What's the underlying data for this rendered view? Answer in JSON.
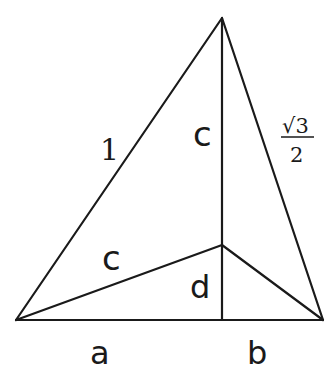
{
  "diagram": {
    "type": "geometry-triangle",
    "points": {
      "apex": {
        "x": 222,
        "y": 18
      },
      "left": {
        "x": 16,
        "y": 320
      },
      "right": {
        "x": 323,
        "y": 320
      },
      "inner": {
        "x": 222,
        "y": 245
      },
      "foot": {
        "x": 222,
        "y": 320
      }
    },
    "labels": {
      "left_side": "1",
      "right_side_numerator": "√3",
      "right_side_denominator": "2",
      "altitude_upper": "c",
      "inner_segment": "c",
      "altitude_lower": "d",
      "base_left": "a",
      "base_right": "b"
    },
    "colors": {
      "stroke": "#1a1a1a",
      "background": "#ffffff"
    }
  }
}
